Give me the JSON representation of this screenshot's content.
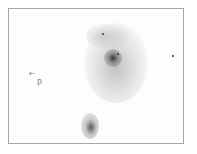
{
  "image": {
    "description": "Negative sketch of a spiral galaxy with a small companion galaxy and field stars",
    "annotations": {
      "arrow": "←",
      "label": "P"
    },
    "colors": {
      "background": "#ffffff",
      "frame": "#a8a8a8",
      "galaxy": "#555555"
    }
  }
}
